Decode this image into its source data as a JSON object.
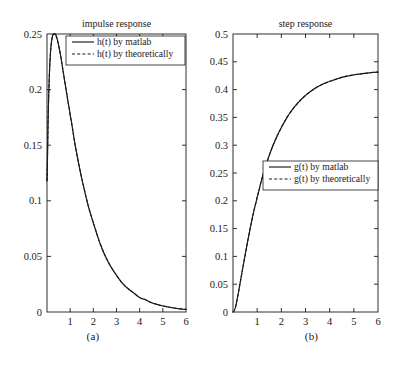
{
  "figure": {
    "background_color": "#ffffff",
    "line_color": "#1a1a1a"
  },
  "panels": [
    {
      "id": "a",
      "caption": "(a)",
      "title": "impulse response",
      "legend": {
        "entries": [
          {
            "label": "h(t) by matlab",
            "style": "solid"
          },
          {
            "label": "h(t) by theoretically",
            "style": "dashed"
          }
        ]
      }
    },
    {
      "id": "b",
      "caption": "(b)",
      "title": "step response",
      "legend": {
        "entries": [
          {
            "label": "g(t) by matlab",
            "style": "solid"
          },
          {
            "label": "g(t) by theoretically",
            "style": "dashed"
          }
        ]
      }
    }
  ],
  "chart_data": [
    {
      "type": "line",
      "title": "impulse response",
      "xlabel": "",
      "ylabel": "",
      "xlim": [
        0,
        6
      ],
      "ylim": [
        0,
        0.25
      ],
      "xticks": [
        0,
        1,
        2,
        3,
        4,
        5,
        6
      ],
      "xticklabels": [
        "",
        "1",
        "2",
        "3",
        "4",
        "5",
        "6"
      ],
      "yticks": [
        0,
        0.05,
        0.1,
        0.15,
        0.2,
        0.25
      ],
      "yticklabels": [
        "0",
        "0.05",
        "0.1",
        "0.15",
        "0.2",
        "0.25"
      ],
      "grid": false,
      "legend_position": "upper right",
      "series": [
        {
          "name": "h(t) by matlab",
          "style": "solid",
          "x": [
            0,
            0.05,
            0.1,
            0.15,
            0.2,
            0.25,
            0.3,
            0.35,
            0.4,
            0.5,
            0.6,
            0.7,
            0.8,
            0.9,
            1.0,
            1.2,
            1.4,
            1.6,
            1.8,
            2.0,
            2.25,
            2.5,
            2.75,
            3.0,
            3.25,
            3.5,
            3.75,
            4.0,
            4.25,
            4.5,
            4.75,
            5.0,
            5.25,
            5.5,
            5.75,
            6.0
          ],
          "y": [
            0.118,
            0.175,
            0.212,
            0.233,
            0.244,
            0.249,
            0.25,
            0.25,
            0.248,
            0.24,
            0.229,
            0.216,
            0.203,
            0.19,
            0.177,
            0.152,
            0.13,
            0.111,
            0.094,
            0.08,
            0.064,
            0.051,
            0.041,
            0.033,
            0.026,
            0.021,
            0.017,
            0.013,
            0.011,
            0.0085,
            0.0068,
            0.0055,
            0.0044,
            0.0035,
            0.0028,
            0.0023
          ]
        },
        {
          "name": "h(t) by theoretically",
          "style": "dashed",
          "x": [
            0,
            0.05,
            0.1,
            0.15,
            0.2,
            0.25,
            0.3,
            0.35,
            0.4,
            0.5,
            0.6,
            0.7,
            0.8,
            0.9,
            1.0,
            1.2,
            1.4,
            1.6,
            1.8,
            2.0,
            2.25,
            2.5,
            2.75,
            3.0,
            3.25,
            3.5,
            3.75,
            4.0,
            4.25,
            4.5,
            4.75,
            5.0,
            5.25,
            5.5,
            5.75,
            6.0
          ],
          "y": [
            0.118,
            0.175,
            0.212,
            0.233,
            0.244,
            0.249,
            0.25,
            0.25,
            0.248,
            0.24,
            0.229,
            0.216,
            0.203,
            0.19,
            0.177,
            0.152,
            0.13,
            0.111,
            0.094,
            0.08,
            0.064,
            0.051,
            0.041,
            0.033,
            0.026,
            0.021,
            0.017,
            0.013,
            0.011,
            0.0085,
            0.0068,
            0.0055,
            0.0044,
            0.0035,
            0.0028,
            0.0023
          ]
        }
      ]
    },
    {
      "type": "line",
      "title": "step response",
      "xlabel": "",
      "ylabel": "",
      "xlim": [
        0,
        6
      ],
      "ylim": [
        0,
        0.5
      ],
      "xticks": [
        0,
        1,
        2,
        3,
        4,
        5,
        6
      ],
      "xticklabels": [
        "",
        "1",
        "2",
        "3",
        "4",
        "5",
        "6"
      ],
      "yticks": [
        0,
        0.05,
        0.1,
        0.15,
        0.2,
        0.25,
        0.3,
        0.35,
        0.4,
        0.45,
        0.5
      ],
      "yticklabels": [
        "0",
        "0.05",
        "0.1",
        "0.15",
        "0.2",
        "0.25",
        "0.3",
        "0.35",
        "0.4",
        "0.45",
        "0.5"
      ],
      "grid": false,
      "legend_position": "lower right",
      "series": [
        {
          "name": "g(t) by matlab",
          "style": "solid",
          "x": [
            0,
            0.1,
            0.2,
            0.3,
            0.4,
            0.5,
            0.6,
            0.7,
            0.8,
            0.9,
            1.0,
            1.2,
            1.4,
            1.6,
            1.8,
            2.0,
            2.25,
            2.5,
            2.75,
            3.0,
            3.25,
            3.5,
            3.75,
            4.0,
            4.5,
            5.0,
            5.5,
            6.0
          ],
          "y": [
            0.0,
            0.0085,
            0.0295,
            0.0535,
            0.078,
            0.102,
            0.1255,
            0.148,
            0.169,
            0.1885,
            0.207,
            0.2405,
            0.269,
            0.2935,
            0.314,
            0.332,
            0.351,
            0.3665,
            0.379,
            0.3895,
            0.398,
            0.405,
            0.4105,
            0.415,
            0.422,
            0.4265,
            0.4295,
            0.4315
          ]
        },
        {
          "name": "g(t) by theoretically",
          "style": "dashed",
          "x": [
            0,
            0.1,
            0.2,
            0.3,
            0.4,
            0.5,
            0.6,
            0.7,
            0.8,
            0.9,
            1.0,
            1.2,
            1.4,
            1.6,
            1.8,
            2.0,
            2.25,
            2.5,
            2.75,
            3.0,
            3.25,
            3.5,
            3.75,
            4.0,
            4.5,
            5.0,
            5.5,
            6.0
          ],
          "y": [
            0.0,
            0.0085,
            0.0295,
            0.0535,
            0.078,
            0.102,
            0.1255,
            0.148,
            0.169,
            0.1885,
            0.207,
            0.2405,
            0.269,
            0.2935,
            0.314,
            0.332,
            0.351,
            0.3665,
            0.379,
            0.3895,
            0.398,
            0.405,
            0.4105,
            0.415,
            0.422,
            0.4265,
            0.4295,
            0.4315
          ]
        }
      ]
    }
  ]
}
